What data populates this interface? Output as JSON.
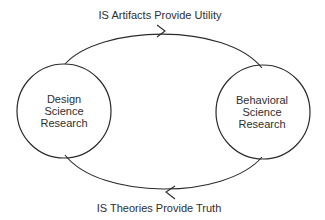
{
  "diagram": {
    "type": "cycle",
    "nodes": [
      {
        "id": "design-science",
        "label_lines": [
          "Design",
          "Science",
          "Research"
        ],
        "center": [
          64,
          111
        ],
        "radius": 47
      },
      {
        "id": "behavioral-science",
        "label_lines": [
          "Behavioral",
          "Science",
          "Research"
        ],
        "center": [
          263,
          112
        ],
        "radius": 47
      }
    ],
    "edges": [
      {
        "from": "design-science",
        "to": "behavioral-science",
        "label": "IS Artifacts Provide Utility",
        "direction": "right",
        "position": "top"
      },
      {
        "from": "behavioral-science",
        "to": "design-science",
        "label": "IS Theories Provide Truth",
        "direction": "left",
        "position": "bottom"
      }
    ],
    "colors": {
      "stroke": "#2a2a2a",
      "text": "#2e2e2e",
      "background": "#ffffff"
    }
  }
}
